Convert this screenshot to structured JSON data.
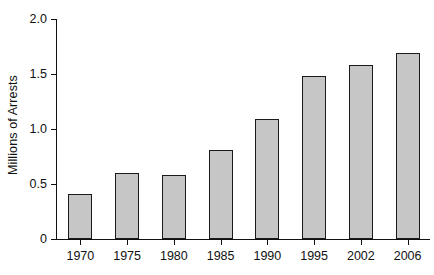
{
  "chart_data": {
    "type": "bar",
    "title": "",
    "xlabel": "",
    "ylabel": "Millions of Arrests",
    "categories": [
      "1970",
      "1975",
      "1980",
      "1985",
      "1990",
      "1995",
      "2002",
      "2006"
    ],
    "values": [
      0.41,
      0.6,
      0.58,
      0.81,
      1.09,
      1.48,
      1.58,
      1.69
    ],
    "ylim": [
      0,
      2.0
    ],
    "yticks": [
      "0",
      "0.5",
      "1.0",
      "1.5",
      "2.0"
    ],
    "ytick_values": [
      0,
      0.5,
      1.0,
      1.5,
      2.0
    ],
    "grid": false,
    "legend": null,
    "bar_color": "#c6c6c6",
    "bar_edge_color": "#1a1a1a",
    "axis_color": "#111111"
  }
}
